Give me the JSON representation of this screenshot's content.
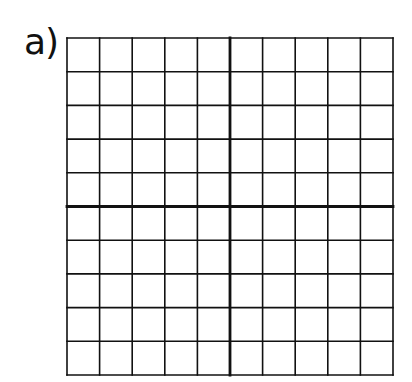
{
  "problem": {
    "label": "a)"
  },
  "grid": {
    "columns": 10,
    "rows": 10,
    "axis_column": 5,
    "axis_row": 5,
    "line_color": "#111111",
    "thin_stroke": 1.6,
    "thick_stroke": 2.8,
    "background": "#ffffff"
  }
}
